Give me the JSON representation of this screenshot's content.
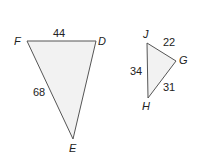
{
  "triangle1": {
    "vertices": {
      "F": "F",
      "D": "D",
      "E": "E"
    },
    "sides": {
      "FD": "44",
      "FE": "68"
    }
  },
  "triangle2": {
    "vertices": {
      "J": "J",
      "G": "G",
      "H": "H"
    },
    "sides": {
      "JG": "22",
      "JH": "34",
      "GH": "31"
    }
  },
  "colors": {
    "fill": "#f2f2f2",
    "stroke": "#555555"
  }
}
